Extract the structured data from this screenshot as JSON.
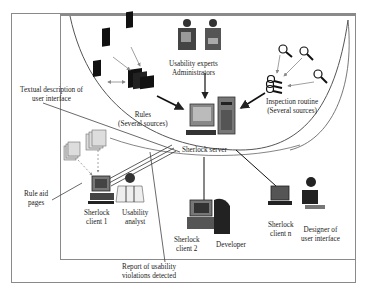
{
  "diagram": {
    "nodes": {
      "usability_experts": {
        "line1": "Usability experts",
        "line2": "Administrators"
      },
      "rules": {
        "line1": "Rules",
        "line2": "(Several sources)"
      },
      "inspection": {
        "line1": "Inspection routine",
        "line2": "(Several sources)"
      },
      "server": {
        "label": "Sherlock server"
      },
      "client1": {
        "line1": "Sherlock",
        "line2": "client 1"
      },
      "analyst": {
        "line1": "Usability",
        "line2": "analyst"
      },
      "client2": {
        "line1": "Sherlock",
        "line2": "client 2"
      },
      "developer": {
        "label": "Developer"
      },
      "clientn": {
        "line1": "Sherlock",
        "line2": "client n"
      },
      "designer": {
        "line1": "Designer of",
        "line2": "user interface"
      }
    },
    "callouts": {
      "textual": {
        "line1": "Textual description of",
        "line2": "user interface"
      },
      "rule_aid": {
        "line1": "Rule aid",
        "line2": "pages"
      },
      "report": {
        "line1": "Report of usability",
        "line2": "violations detected"
      }
    }
  }
}
